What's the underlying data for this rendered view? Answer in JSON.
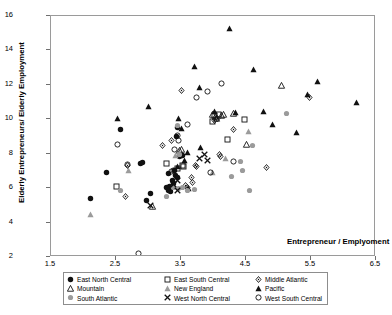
{
  "chart_data": {
    "type": "scatter",
    "title": "",
    "xlabel": "Entrepreneur / Emplyoment",
    "ylabel": "Elderly Entrepreneurs/ Elderly Employment",
    "xlim": [
      1.5,
      6.5
    ],
    "ylim": [
      2,
      16
    ],
    "xticks": [
      "1.5",
      "2.5",
      "3.5",
      "4.5",
      "5.5",
      "6.5"
    ],
    "yticks": [
      "2",
      "4",
      "6",
      "8",
      "10",
      "12",
      "14",
      "16"
    ],
    "grid": false,
    "legend_position": "below-plot",
    "series": [
      {
        "name": "East North Central",
        "marker": "filled-circle",
        "color": "#111111",
        "points": [
          [
            2.11,
            5.42
          ],
          [
            2.35,
            6.92
          ],
          [
            2.87,
            7.42
          ],
          [
            2.9,
            7.48
          ],
          [
            2.57,
            9.38
          ],
          [
            3.03,
            5.7
          ],
          [
            2.97,
            5.28
          ],
          [
            3.37,
            6.46
          ],
          [
            3.38,
            6.28
          ],
          [
            3.4,
            7.02
          ],
          [
            3.42,
            6.74
          ],
          [
            3.44,
            6.64
          ],
          [
            3.43,
            9.02
          ],
          [
            3.44,
            9.52
          ],
          [
            3.47,
            7.86
          ],
          [
            3.5,
            7.92
          ],
          [
            3.52,
            7.88
          ],
          [
            3.31,
            6.86
          ],
          [
            3.34,
            5.8
          ],
          [
            3.33,
            6.1
          ],
          [
            3.28,
            6.02
          ],
          [
            3.3,
            5.88
          ]
        ]
      },
      {
        "name": "East South Central",
        "marker": "open-square",
        "color": "#111111",
        "points": [
          [
            2.5,
            6.1
          ],
          [
            3.28,
            7.44
          ],
          [
            3.45,
            7.12
          ],
          [
            3.52,
            7.3
          ],
          [
            3.54,
            7.28
          ],
          [
            3.98,
            9.88
          ],
          [
            4.22,
            8.82
          ],
          [
            4.48,
            9.98
          ],
          [
            4.02,
            10.22
          ],
          [
            4.08,
            10.28
          ]
        ]
      },
      {
        "name": "Middle Atlantic",
        "marker": "open-diamond",
        "color": "#111111",
        "points": [
          [
            2.64,
            5.54
          ],
          [
            2.68,
            7.32
          ],
          [
            3.22,
            8.5
          ],
          [
            3.36,
            8.78
          ],
          [
            3.51,
            11.68
          ],
          [
            4.02,
            9.92
          ],
          [
            4.06,
            10.02
          ],
          [
            4.31,
            9.38
          ],
          [
            4.09,
            7.96
          ],
          [
            4.11,
            7.84
          ],
          [
            3.72,
            7.34
          ],
          [
            3.74,
            7.28
          ],
          [
            3.66,
            6.64
          ],
          [
            3.68,
            6.3
          ],
          [
            3.6,
            6.02
          ],
          [
            3.57,
            6.16
          ],
          [
            4.81,
            7.2
          ],
          [
            5.48,
            11.24
          ]
        ]
      },
      {
        "name": "Mountain",
        "marker": "open-triangle",
        "color": "#111111",
        "points": [
          [
            3.06,
            4.94
          ],
          [
            3.48,
            8.18
          ],
          [
            3.5,
            8.22
          ],
          [
            4.03,
            10.18
          ],
          [
            4.05,
            10.04
          ],
          [
            4.12,
            10.22
          ],
          [
            4.16,
            10.26
          ],
          [
            4.3,
            10.36
          ],
          [
            4.51,
            8.52
          ],
          [
            5.04,
            11.98
          ],
          [
            3.98,
            10.3
          ]
        ]
      },
      {
        "name": "New England",
        "marker": "filled-triangle-grey",
        "color": "#9b9b9b",
        "points": [
          [
            2.11,
            4.46
          ],
          [
            2.69,
            7.02
          ],
          [
            3.42,
            7.92
          ],
          [
            4.18,
            7.7
          ],
          [
            4.54,
            9.28
          ],
          [
            3.98,
            6.92
          ]
        ]
      },
      {
        "name": "Pacific",
        "marker": "filled-triangle",
        "color": "#111111",
        "points": [
          [
            2.52,
            10.04
          ],
          [
            3.0,
            10.72
          ],
          [
            3.46,
            10.06
          ],
          [
            3.5,
            9.46
          ],
          [
            3.7,
            13.08
          ],
          [
            3.78,
            11.82
          ],
          [
            4.02,
            10.46
          ],
          [
            4.25,
            15.28
          ],
          [
            4.62,
            12.88
          ],
          [
            4.77,
            10.44
          ],
          [
            4.9,
            9.68
          ],
          [
            5.28,
            9.22
          ],
          [
            5.45,
            11.44
          ],
          [
            5.6,
            12.2
          ],
          [
            6.2,
            10.98
          ],
          [
            3.6,
            8.06
          ],
          [
            3.55,
            7.6
          ],
          [
            3.44,
            7.28
          ],
          [
            3.8,
            8.38
          ],
          [
            4.34,
            10.42
          ],
          [
            3.62,
            5.98
          ]
        ]
      },
      {
        "name": "South Atlantic",
        "marker": "filled-circle-grey",
        "color": "#9b9b9b",
        "points": [
          [
            2.57,
            5.88
          ],
          [
            3.28,
            5.54
          ],
          [
            3.38,
            6.02
          ],
          [
            3.44,
            9.62
          ],
          [
            3.48,
            7.96
          ],
          [
            3.7,
            5.94
          ],
          [
            4.28,
            6.66
          ],
          [
            4.44,
            7.0
          ],
          [
            4.56,
            5.84
          ],
          [
            4.6,
            8.46
          ],
          [
            5.12,
            10.36
          ],
          [
            6.52,
            13.46
          ],
          [
            3.46,
            5.96
          ],
          [
            3.52,
            6.04
          ],
          [
            3.6,
            5.88
          ],
          [
            4.42,
            7.52
          ]
        ]
      },
      {
        "name": "West North Central",
        "marker": "cross-x",
        "color": "#111111",
        "points": [
          [
            3.03,
            5.02
          ],
          [
            3.44,
            6.42
          ],
          [
            3.45,
            5.88
          ],
          [
            3.78,
            7.72
          ],
          [
            3.86,
            7.96
          ],
          [
            3.9,
            7.6
          ],
          [
            3.38,
            6.22
          ]
        ]
      },
      {
        "name": "West South Central",
        "marker": "open-circle",
        "color": "#111111",
        "points": [
          [
            2.52,
            8.54
          ],
          [
            2.68,
            7.4
          ],
          [
            2.84,
            2.18
          ],
          [
            3.44,
            9.04
          ],
          [
            3.4,
            8.26
          ],
          [
            3.6,
            9.68
          ],
          [
            3.74,
            11.26
          ],
          [
            3.9,
            11.62
          ],
          [
            4.12,
            12.06
          ],
          [
            4.3,
            7.56
          ],
          [
            3.96,
            6.88
          ],
          [
            3.38,
            7.0
          ],
          [
            3.36,
            6.96
          ],
          [
            3.46,
            8.74
          ]
        ]
      }
    ]
  },
  "legend": {
    "entries": [
      {
        "label": "East North Central",
        "marker": "filled-circle"
      },
      {
        "label": "East South Central",
        "marker": "open-square"
      },
      {
        "label": "Middle Atlantic",
        "marker": "open-diamond"
      },
      {
        "label": "Mountain",
        "marker": "open-triangle"
      },
      {
        "label": "New England",
        "marker": "filled-triangle-grey"
      },
      {
        "label": "Pacific",
        "marker": "filled-triangle"
      },
      {
        "label": "South Atlantic",
        "marker": "filled-circle-grey"
      },
      {
        "label": "West North Central",
        "marker": "cross-x"
      },
      {
        "label": "West South Central",
        "marker": "open-circle"
      }
    ]
  },
  "colors": {
    "black": "#111111",
    "grey": "#9b9b9b",
    "frame": "#9a9a9a",
    "background": "#ffffff"
  }
}
